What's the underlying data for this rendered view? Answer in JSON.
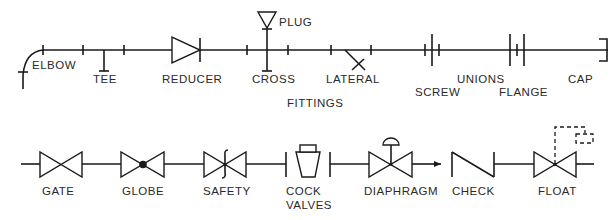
{
  "sections": {
    "fittings": {
      "title": "FITTINGS",
      "items": [
        {
          "label": "ELBOW"
        },
        {
          "label": "TEE"
        },
        {
          "label": "REDUCER"
        },
        {
          "label": "CROSS"
        },
        {
          "label": "PLUG"
        },
        {
          "label": "LATERAL"
        },
        {
          "label": "UNIONS"
        },
        {
          "label": "SCREW"
        },
        {
          "label": "FLANGE"
        },
        {
          "label": "CAP"
        }
      ]
    },
    "valves": {
      "title": "VALVES",
      "items": [
        {
          "label": "GATE"
        },
        {
          "label": "GLOBE"
        },
        {
          "label": "SAFETY"
        },
        {
          "label": "COCK"
        },
        {
          "label": "DIAPHRAGM"
        },
        {
          "label": "CHECK"
        },
        {
          "label": "FLOAT"
        }
      ]
    }
  },
  "colors": {
    "line": "#1a1a1a",
    "background": "#ffffff"
  }
}
